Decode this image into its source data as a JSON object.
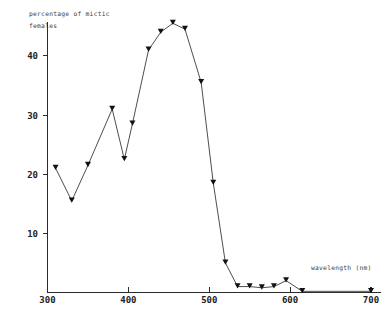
{
  "chart_data": {
    "type": "line",
    "title": "",
    "xlabel": "wavelength (nm)",
    "ylabel": "percentage of mictic females",
    "ylabel_line1": "percentage of mictic",
    "ylabel_line2": "females",
    "xlim": [
      290,
      715
    ],
    "ylim": [
      0,
      48
    ],
    "xticks": [
      300,
      400,
      500,
      600,
      700
    ],
    "xtick_labels": [
      "300",
      "400",
      "500",
      "600",
      "700"
    ],
    "yticks": [
      10,
      20,
      30,
      40
    ],
    "ytick_labels": [
      "10",
      "20",
      "30",
      "40"
    ],
    "grid": false,
    "legend": false,
    "marker": "triangle-down",
    "line_color": "#3a3a3a",
    "marker_color": "#111111",
    "axis_color": "#2b2b2b",
    "background_color": "#ffffff",
    "x": [
      310,
      330,
      350,
      380,
      395,
      405,
      425,
      440,
      455,
      470,
      490,
      505,
      520,
      535,
      550,
      565,
      580,
      595,
      615,
      700
    ],
    "values": [
      21.0,
      15.5,
      21.5,
      31.0,
      22.5,
      28.5,
      41.0,
      44.0,
      45.5,
      44.5,
      35.5,
      18.5,
      5.0,
      1.0,
      1.0,
      0.8,
      1.0,
      2.0,
      0.2,
      0.2
    ],
    "series": [
      {
        "name": "percentage of mictic females",
        "points": [
          {
            "x": 310,
            "y": 21.0
          },
          {
            "x": 330,
            "y": 15.5
          },
          {
            "x": 350,
            "y": 21.5
          },
          {
            "x": 380,
            "y": 31.0
          },
          {
            "x": 395,
            "y": 22.5
          },
          {
            "x": 405,
            "y": 28.5
          },
          {
            "x": 425,
            "y": 41.0
          },
          {
            "x": 440,
            "y": 44.0
          },
          {
            "x": 455,
            "y": 45.5
          },
          {
            "x": 470,
            "y": 44.5
          },
          {
            "x": 490,
            "y": 35.5
          },
          {
            "x": 505,
            "y": 18.5
          },
          {
            "x": 520,
            "y": 5.0
          },
          {
            "x": 535,
            "y": 1.0
          },
          {
            "x": 550,
            "y": 1.0
          },
          {
            "x": 565,
            "y": 0.8
          },
          {
            "x": 580,
            "y": 1.0
          },
          {
            "x": 595,
            "y": 2.0
          },
          {
            "x": 615,
            "y": 0.2
          },
          {
            "x": 700,
            "y": 0.2
          }
        ]
      }
    ]
  }
}
